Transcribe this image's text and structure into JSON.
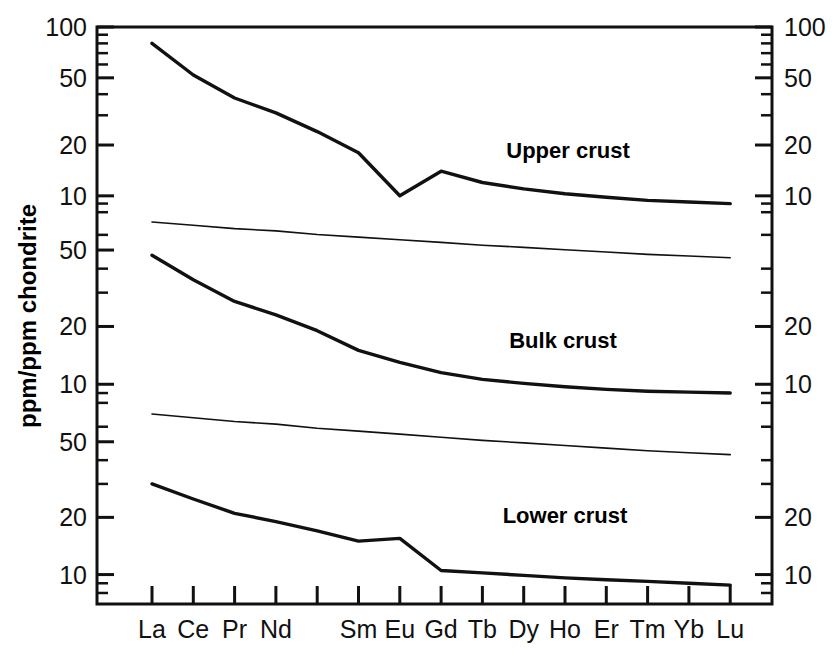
{
  "chart_data": {
    "type": "line",
    "title": "",
    "subtitle": "",
    "xlabel": "",
    "ylabel": "ppm/ppm chondrite",
    "grid": false,
    "legend_position": "inline-annotations",
    "x_categories": [
      "La",
      "Ce",
      "Pr",
      "Nd",
      "Pm",
      "Sm",
      "Eu",
      "Gd",
      "Tb",
      "Dy",
      "Ho",
      "Er",
      "Tm",
      "Yb",
      "Lu"
    ],
    "x_tick_labels": [
      "La",
      "Ce",
      "Pr",
      "Nd",
      "",
      "Sm",
      "Eu",
      "Gd",
      "Tb",
      "Dy",
      "Ho",
      "Er",
      "Tm",
      "Yb",
      "Lu"
    ],
    "panels": [
      {
        "name": "upper-crust",
        "annotation": "Upper crust",
        "y_scale": "log",
        "ylim": [
          7,
          100
        ],
        "left_tick_labels": [
          "100",
          "50",
          "20",
          "10"
        ],
        "left_tick_values": [
          100,
          50,
          20,
          10
        ],
        "right_tick_labels": [
          "100",
          "50",
          "20",
          "10"
        ],
        "right_tick_values": [
          100,
          50,
          20,
          10
        ]
      },
      {
        "name": "bulk-crust",
        "annotation": "Bulk crust",
        "y_scale": "log",
        "ylim": [
          7,
          70
        ],
        "left_tick_labels": [
          "50",
          "20",
          "10"
        ],
        "left_tick_values": [
          50,
          20,
          10
        ],
        "right_tick_labels": [
          "20",
          "10"
        ],
        "right_tick_values": [
          20,
          10
        ]
      },
      {
        "name": "lower-crust",
        "annotation": "Lower crust",
        "y_scale": "log",
        "ylim": [
          7,
          70
        ],
        "left_tick_labels": [
          "50",
          "20",
          "10"
        ],
        "left_tick_values": [
          50,
          20,
          10
        ],
        "right_tick_labels": [
          "20",
          "10"
        ],
        "right_tick_values": [
          20,
          10
        ]
      }
    ],
    "series": [
      {
        "name": "Upper crust",
        "panel": "upper-crust",
        "style": "thick",
        "values": [
          80,
          52,
          38,
          31,
          24,
          18,
          10,
          14,
          12,
          11,
          10.3,
          9.8,
          9.4,
          9.2,
          9.0
        ]
      },
      {
        "name": "Bulk crust",
        "panel": "bulk-crust",
        "style": "thick",
        "values": [
          47,
          35,
          27,
          23,
          19,
          15,
          13,
          11.5,
          10.6,
          10.1,
          9.7,
          9.4,
          9.2,
          9.1,
          9.0
        ]
      },
      {
        "name": "Lower crust",
        "panel": "lower-crust",
        "style": "thick",
        "values": [
          30,
          25,
          21,
          19,
          17,
          15,
          15.5,
          10.5,
          10.2,
          9.9,
          9.6,
          9.4,
          9.2,
          9.0,
          8.8
        ]
      },
      {
        "name": "upper-panel-baseline",
        "panel": "upper-crust",
        "style": "thin",
        "values": [
          7.0,
          6.7,
          6.4,
          6.2,
          5.9,
          5.7,
          5.5,
          5.3,
          5.1,
          4.95,
          4.8,
          4.65,
          4.5,
          4.4,
          4.3
        ]
      },
      {
        "name": "bulk-panel-baseline",
        "panel": "bulk-crust",
        "style": "thin",
        "values": [
          7.0,
          6.7,
          6.4,
          6.2,
          5.9,
          5.7,
          5.5,
          5.3,
          5.1,
          4.95,
          4.8,
          4.65,
          4.5,
          4.4,
          4.3
        ]
      }
    ],
    "annotations": [
      {
        "text": "Upper crust",
        "x_category": "Gd",
        "panel": "upper-crust"
      },
      {
        "text": "Bulk crust",
        "x_category": "Gd",
        "panel": "bulk-crust"
      },
      {
        "text": "Lower crust",
        "x_category": "Gd",
        "panel": "lower-crust"
      }
    ]
  },
  "axes": {
    "y_label": "ppm/ppm chondrite",
    "left_labels": [
      "100",
      "50",
      "20",
      "10",
      "50",
      "20",
      "10",
      "50",
      "20",
      "10"
    ],
    "right_labels": [
      "100",
      "50",
      "20",
      "10",
      "20",
      "10",
      "20",
      "10"
    ],
    "x_labels": [
      "La",
      "Ce",
      "Pr",
      "Nd",
      "Sm",
      "Eu",
      "Gd",
      "Tb",
      "Dy",
      "Ho",
      "Er",
      "Tm",
      "Yb",
      "Lu"
    ]
  },
  "curve_labels": {
    "upper": "Upper crust",
    "bulk": "Bulk crust",
    "lower": "Lower crust"
  }
}
